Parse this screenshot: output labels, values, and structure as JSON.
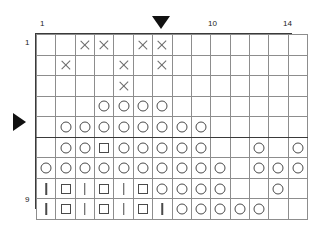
{
  "chart_data": {
    "type": "table",
    "columns": 14,
    "rows": 9,
    "xlabel": "",
    "ylabel": "",
    "grid": true,
    "legend_position": "none",
    "col_tick_labels": [
      {
        "col": 1,
        "label": "1"
      },
      {
        "col": 10,
        "label": "10"
      },
      {
        "col": 14,
        "label": "14"
      }
    ],
    "row_tick_labels": [
      {
        "row": 1,
        "label": "1"
      },
      {
        "row": 9,
        "label": "9"
      }
    ],
    "symbol_legend": {
      "cross": "X",
      "circle": "O",
      "square": "square",
      "bar": "I",
      "empty": "blank"
    },
    "heavy_column_separators": [
      7,
      11
    ],
    "heavy_row_separators": [
      5
    ],
    "markers": [
      {
        "name": "column-marker",
        "shape": "triangle-down",
        "position": "above-column-7"
      },
      {
        "name": "row-marker",
        "shape": "triangle-right",
        "position": "left-of-row-5"
      }
    ],
    "cells": [
      [
        "",
        "",
        "cross",
        "cross",
        "",
        "cross",
        "cross",
        "",
        "",
        "",
        "",
        "",
        "",
        ""
      ],
      [
        "",
        "cross",
        "",
        "",
        "cross",
        "",
        "cross",
        "",
        "",
        "",
        "",
        "",
        "",
        ""
      ],
      [
        "",
        "",
        "",
        "",
        "cross",
        "",
        "",
        "",
        "",
        "",
        "",
        "",
        "",
        ""
      ],
      [
        "",
        "",
        "",
        "circle",
        "circle",
        "circle",
        "circle",
        "",
        "",
        "",
        "",
        "",
        "",
        ""
      ],
      [
        "",
        "circle",
        "circle",
        "circle",
        "circle",
        "circle",
        "circle",
        "circle",
        "circle",
        "",
        "",
        "",
        "",
        ""
      ],
      [
        "",
        "circle",
        "circle",
        "square",
        "circle",
        "circle",
        "circle",
        "circle",
        "circle",
        "",
        "",
        "circle",
        "",
        "circle"
      ],
      [
        "circle",
        "circle",
        "circle",
        "circle",
        "circle",
        "circle",
        "circle",
        "circle",
        "circle",
        "circle",
        "",
        "circle",
        "circle",
        "circle"
      ],
      [
        "bar",
        "square",
        "bar",
        "square",
        "bar",
        "square",
        "circle",
        "circle",
        "circle",
        "circle",
        "",
        "",
        "circle",
        ""
      ],
      [
        "bar",
        "square",
        "bar",
        "square",
        "bar",
        "square",
        "bar",
        "circle",
        "circle",
        "circle",
        "circle",
        "circle",
        "",
        ""
      ]
    ]
  },
  "labels": {
    "top_left_col": "1",
    "top_mid_col": "10",
    "top_right_col": "14",
    "bottom_left_col": "1",
    "bottom_mid_col": "10",
    "bottom_right_col": "14",
    "left_top_row": "1",
    "right_top_row": "1",
    "left_bottom_row": "9",
    "right_bottom_row": "9"
  }
}
